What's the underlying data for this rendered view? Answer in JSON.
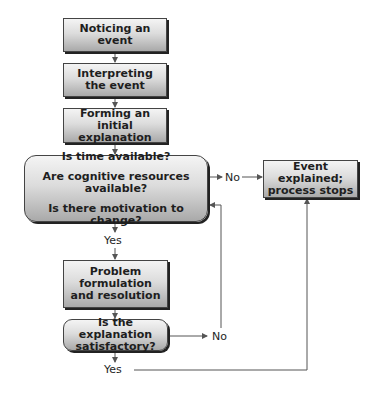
{
  "diagram": {
    "nodes": {
      "noticing": {
        "line1": "Noticing an",
        "line2": "event"
      },
      "interpreting": {
        "line1": "Interpreting",
        "line2": "the event"
      },
      "forming": {
        "line1": "Forming an",
        "line2": "initial explanation"
      },
      "decision": {
        "q1": "Is time available?",
        "q2": "Are cognitive resources available?",
        "q3": "Is there motivation to change?"
      },
      "explained": {
        "line1": "Event explained;",
        "line2": "process stops"
      },
      "problem": {
        "line1": "Problem",
        "line2": "formulation",
        "line3": "and resolution"
      },
      "satisfactory": {
        "line1": "Is the explanation",
        "line2": "satisfactory?"
      }
    },
    "labels": {
      "decision_no": "No",
      "decision_yes": "Yes",
      "satisfactory_no": "No",
      "satisfactory_yes": "Yes"
    },
    "colors": {
      "line": "#555555",
      "text": "#1e1e1e"
    }
  }
}
